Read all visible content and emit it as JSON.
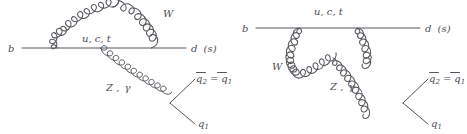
{
  "figure": {
    "background_color": "#ffffff",
    "line_color": "#55555c",
    "label_color": "#4c4c53"
  },
  "diagrams": [
    {
      "id": "left-penguin",
      "name": "self-energy-type penguin with W loop above fermion line",
      "labels": {
        "incoming_quark": "b",
        "outgoing_quark": "d (s)",
        "outgoing_quark_main": "d",
        "outgoing_quark_paren": "(s)",
        "loop_quarks": "u, c, t",
        "w_boson": "W",
        "gauge_boson": "Z, γ",
        "gauge_boson_z": "Z",
        "gauge_boson_gamma": "γ",
        "antiquark_pair": "q2 = q1",
        "antiquark_left": "q",
        "antiquark_left_sub": "2",
        "equals": "=",
        "antiquark_right": "q",
        "antiquark_right_sub": "1",
        "quark_out": "q",
        "quark_out_sub": "1"
      }
    },
    {
      "id": "right-penguin",
      "name": "vertex-type penguin with W below fermion line",
      "labels": {
        "incoming_quark": "b",
        "outgoing_quark": "d (s)",
        "outgoing_quark_main": "d",
        "outgoing_quark_paren": "(s)",
        "loop_quarks": "u, c, t",
        "w_boson": "W",
        "gauge_boson": "Z, γ",
        "gauge_boson_z": "Z",
        "gauge_boson_gamma": "γ",
        "antiquark_pair": "q2 = q1",
        "antiquark_left": "q",
        "antiquark_left_sub": "2",
        "equals": "=",
        "antiquark_right": "q",
        "antiquark_right_sub": "1",
        "quark_out": "q",
        "quark_out_sub": "1"
      }
    }
  ]
}
